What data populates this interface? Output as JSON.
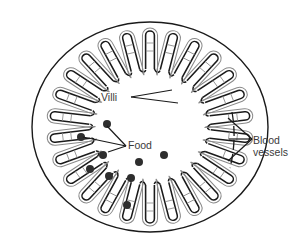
{
  "diagram": {
    "labels": {
      "villi": "Villi",
      "food": "Food",
      "blood_vessels_line1": "Blood",
      "blood_vessels_line2": "vessels"
    },
    "colors": {
      "outline": "#1a1a1a",
      "vessel": "#8a8a8a",
      "food_particle": "#2e2e2e",
      "label_text": "#3a3a3a",
      "background": "#ffffff"
    },
    "geometry": {
      "center": [
        150,
        127
      ],
      "outer_radius_x": 118,
      "outer_radius_y": 105,
      "villi_count": 26,
      "villi_inner_radius": 58,
      "villi_outer_radius": 96
    },
    "food_particles": [
      [
        107,
        124
      ],
      [
        81,
        137
      ],
      [
        103,
        155
      ],
      [
        139,
        162
      ],
      [
        164,
        155
      ],
      [
        90,
        169
      ],
      [
        109,
        176
      ],
      [
        131,
        178
      ],
      [
        127,
        205
      ]
    ],
    "pointers": {
      "villi_origin": [
        131,
        97
      ],
      "villi_targets": [
        [
          172,
          90
        ],
        [
          178,
          103
        ]
      ],
      "food_origin": [
        126,
        146
      ],
      "food_targets": [
        [
          107,
          126
        ],
        [
          83,
          137
        ],
        [
          108,
          152
        ]
      ],
      "blood_origin": [
        252,
        139
      ],
      "blood_targets": [
        [
          228,
          118
        ],
        [
          229,
          139
        ],
        [
          228,
          161
        ]
      ]
    }
  }
}
